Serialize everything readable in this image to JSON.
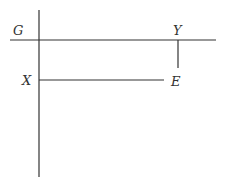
{
  "diagram": {
    "labels": {
      "G": "G",
      "Y": "Y",
      "X": "X",
      "E": "E"
    },
    "colors": {
      "line": "#333333",
      "background": "#ffffff"
    },
    "lines": [
      {
        "name": "vertical-main-line",
        "x1": 39,
        "y1": 10,
        "x2": 39,
        "y2": 177
      },
      {
        "name": "horizontal-top-line",
        "x1": 10,
        "y1": 40,
        "x2": 216,
        "y2": 40
      },
      {
        "name": "Y-tick-line",
        "x1": 178,
        "y1": 40,
        "x2": 178,
        "y2": 68
      },
      {
        "name": "X-to-E-line",
        "x1": 39,
        "y1": 80,
        "x2": 164,
        "y2": 80
      }
    ]
  }
}
